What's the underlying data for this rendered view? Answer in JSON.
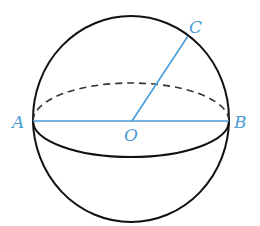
{
  "diagram": {
    "type": "sphere-cross-section",
    "labels": {
      "A": "A",
      "B": "B",
      "C": "C",
      "O": "O"
    },
    "colors": {
      "outline": "#111111",
      "accent": "#4a9bd8"
    }
  }
}
